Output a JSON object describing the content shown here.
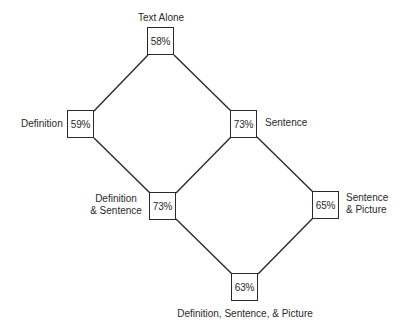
{
  "diagram": {
    "type": "lattice",
    "nodes": [
      {
        "id": "text_alone",
        "label": "Text Alone",
        "value": "58%"
      },
      {
        "id": "definition",
        "label": "Definition",
        "value": "59%"
      },
      {
        "id": "sentence",
        "label": "Sentence",
        "value": "73%"
      },
      {
        "id": "def_sentence",
        "label_line1": "Definition",
        "label_line2": "& Sentence",
        "value": "73%"
      },
      {
        "id": "sentence_picture",
        "label_line1": "Sentence",
        "label_line2": "& Picture",
        "value": "65%"
      },
      {
        "id": "def_sentence_picture",
        "label": "Definition, Sentence, & Picture",
        "value": "63%"
      }
    ],
    "edges": [
      [
        "text_alone",
        "definition"
      ],
      [
        "text_alone",
        "sentence"
      ],
      [
        "definition",
        "def_sentence"
      ],
      [
        "sentence",
        "def_sentence"
      ],
      [
        "sentence",
        "sentence_picture"
      ],
      [
        "def_sentence",
        "def_sentence_picture"
      ],
      [
        "sentence_picture",
        "def_sentence_picture"
      ]
    ],
    "line_color": "#2a2a2a"
  }
}
